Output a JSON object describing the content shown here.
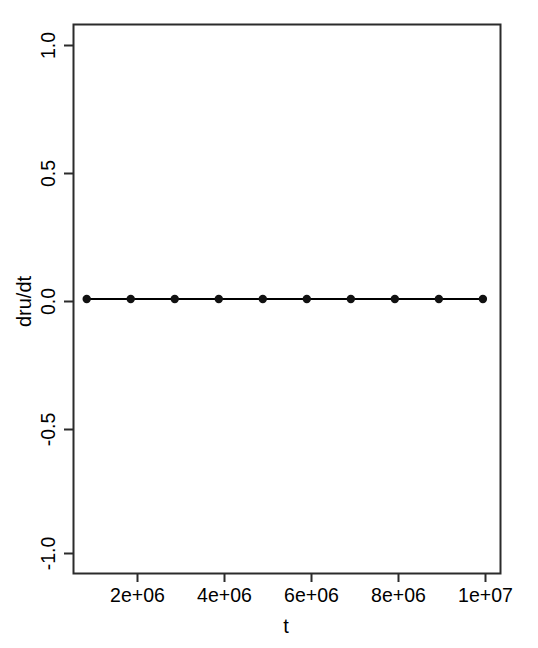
{
  "chart_data": {
    "type": "line",
    "title": "",
    "subtitle": "",
    "xlabel": "t",
    "ylabel": "dru/dt",
    "x": [
      1000000,
      2000000,
      3000000,
      4000000,
      5000000,
      6000000,
      7000000,
      8000000,
      9000000,
      10000000
    ],
    "series": [
      {
        "name": "dru/dt",
        "values": [
          0,
          0,
          0,
          0,
          0,
          0,
          0,
          0,
          0,
          0
        ],
        "color": "#000000",
        "marker": "filled-circle",
        "line_style": "solid"
      }
    ],
    "xlim": [
      700000,
      10400000
    ],
    "ylim": [
      -1.12,
      1.12
    ],
    "xticks": [
      2000000,
      4000000,
      6000000,
      8000000,
      10000000
    ],
    "xticklabels": [
      "2e+06",
      "4e+06",
      "6e+06",
      "8e+06",
      "1e+07"
    ],
    "yticks": [
      1.0,
      0.5,
      0.0,
      -0.5,
      -1.0
    ],
    "yticklabels": [
      "1.0",
      "0.5",
      "0.0",
      "-0.5",
      "-1.0"
    ],
    "grid": false,
    "legend": null,
    "legend_position": "none",
    "y_tick_label_rotation": 90,
    "box_frame": true
  },
  "axes": {
    "x_title": "t",
    "y_title": "dru/dt",
    "x_tick_labels": [
      "2e+06",
      "4e+06",
      "6e+06",
      "8e+06",
      "1e+07"
    ],
    "y_tick_labels": [
      "1.0",
      "0.5",
      "0.0",
      "-0.5",
      "-1.0"
    ]
  },
  "style": {
    "background": "#ffffff",
    "foreground": "#000000",
    "line_color": "#1a1a1a",
    "point_color": "#111111"
  }
}
